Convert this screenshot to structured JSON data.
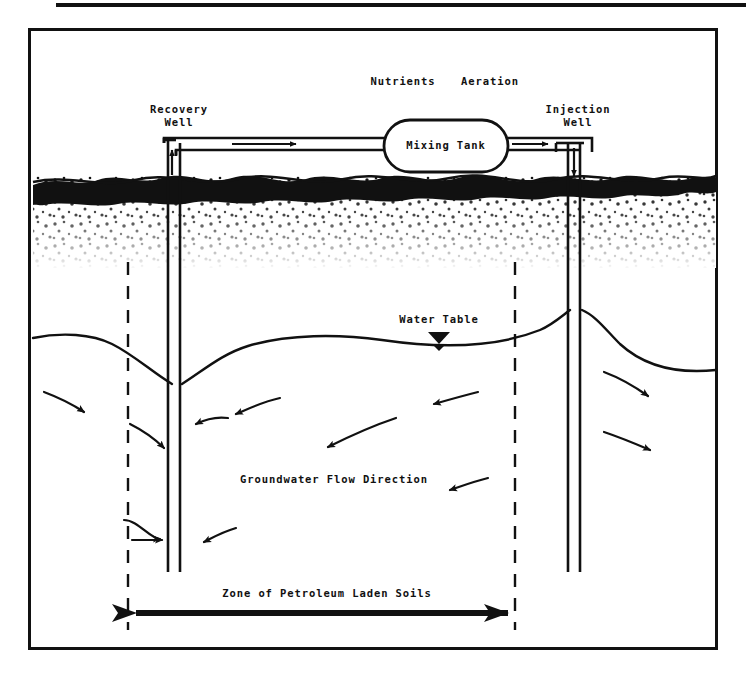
{
  "figure": {
    "type": "cross-section-schematic",
    "ink_color": "#111111",
    "background_color": "#ffffff"
  },
  "labels": {
    "nutrients": "Nutrients",
    "aeration": "Aeration",
    "recovery_well": "Recovery\nWell",
    "injection_well": "Injection\nWell",
    "mixing_tank": "Mixing Tank",
    "water_table": "Water Table",
    "groundwater_flow": "Groundwater Flow Direction",
    "zone": "Zone of Petroleum Laden Soils"
  },
  "components": [
    {
      "name": "recovery-well",
      "role": "extraction",
      "flow_arrow": "up"
    },
    {
      "name": "injection-well",
      "role": "reinjection",
      "flow_arrow": "down"
    },
    {
      "name": "mixing-tank",
      "role": "treatment",
      "shape": "stadium"
    },
    {
      "name": "return-pipe-left",
      "flow_arrow": "right"
    },
    {
      "name": "supply-pipe-right",
      "flow_arrow": "right-then-down"
    },
    {
      "name": "soil-layer",
      "role": "stippled unsaturated zone"
    },
    {
      "name": "water-table",
      "role": "phreatic surface with cone of depression and injection mound"
    },
    {
      "name": "contaminant-zone",
      "role": "double-headed extent arrow"
    }
  ],
  "flow_arrows": {
    "count": 12,
    "description": "groundwater flow vectors converging on the recovery well and diverging from the injection well"
  }
}
